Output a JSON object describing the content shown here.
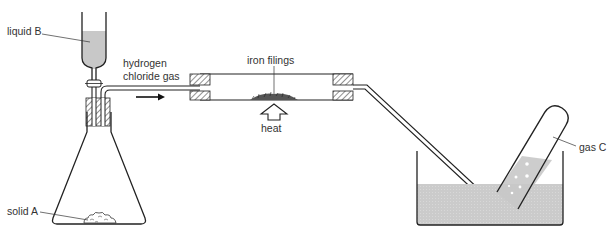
{
  "diagram": {
    "type": "chemistry-apparatus",
    "labels": {
      "liquid_b": "liquid B",
      "solid_a": "solid A",
      "hydrogen_chloride_gas_line1": "hydrogen",
      "hydrogen_chloride_gas_line2": "chloride gas",
      "iron_filings": "iron filings",
      "heat": "heat",
      "gas_c": "gas C"
    },
    "components": [
      {
        "name": "dropping-funnel",
        "contains": "liquid B"
      },
      {
        "name": "conical-flask",
        "contains": "solid A"
      },
      {
        "name": "delivery-tube",
        "carries": "hydrogen chloride gas"
      },
      {
        "name": "combustion-tube",
        "contains": "iron filings"
      },
      {
        "name": "heat-arrow"
      },
      {
        "name": "water-trough"
      },
      {
        "name": "test-tube",
        "collects": "gas C"
      }
    ],
    "colors": {
      "line": "#222222",
      "liquid": "#c8c8c8",
      "hatch": "#555555",
      "text": "#333333"
    }
  }
}
